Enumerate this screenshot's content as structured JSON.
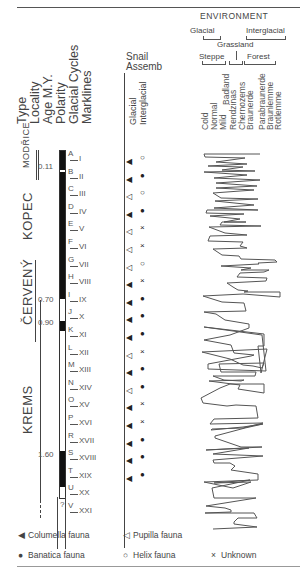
{
  "headers": {
    "columns": [
      "Type",
      "Locality",
      "Age M.Y.",
      "Polarity",
      "Glacial Cycles",
      "Marklines"
    ],
    "snail": {
      "title_line1": "Snail",
      "title_line2": "Assemb",
      "sub": [
        "Glacial",
        "Interglacial"
      ]
    },
    "environment": {
      "title": "ENVIRONMENT",
      "glacial": "Glacial",
      "interglacial": "Interglacial",
      "grassland": "Grassland",
      "steppe": "Steppe",
      "forest": "Forest",
      "types": [
        "Cold",
        "Normal",
        "Mild",
        "Badland",
        "Rendzinas",
        "Chernozems",
        "Braunerde",
        "Parabraunerde",
        "Braunlemme",
        "Rotlemme"
      ]
    }
  },
  "localities": [
    "MODŘICE",
    "KOPEC",
    "ČERVENÝ",
    "KREMS"
  ],
  "ages": [
    "0.11",
    "0.70",
    "0.90",
    "1.60"
  ],
  "glacial_cycles": [
    "A",
    "B",
    "C",
    "D",
    "E",
    "F",
    "G",
    "H",
    "I",
    "J",
    "K",
    "L",
    "M",
    "N",
    "O",
    "P",
    "R",
    "S",
    "T",
    "U",
    "V"
  ],
  "marklines": [
    "I",
    "II",
    "III",
    "IV",
    "V",
    "VI",
    "VII",
    "VIII",
    "IX",
    "X",
    "XI",
    "XII",
    "XIII",
    "XIV",
    "XV",
    "XVI",
    "XVII",
    "XVIII",
    "XIX",
    "XX",
    "XXI"
  ],
  "question_mark": "?",
  "snail_rows": [
    {
      "glacial": "◀",
      "interglacial": "○"
    },
    {
      "glacial": "◀",
      "interglacial": "●"
    },
    {
      "glacial": "◁",
      "interglacial": "○"
    },
    {
      "glacial": "◀",
      "interglacial": "●"
    },
    {
      "glacial": "◁",
      "interglacial": "×"
    },
    {
      "glacial": "◁",
      "interglacial": "×"
    },
    {
      "glacial": "◁",
      "interglacial": "○"
    },
    {
      "glacial": "◀",
      "interglacial": "×"
    },
    {
      "glacial": "◀",
      "interglacial": "●"
    },
    {
      "glacial": "◀",
      "interglacial": "●"
    },
    {
      "glacial": "◀",
      "interglacial": "●"
    },
    {
      "glacial": "◁",
      "interglacial": "×"
    },
    {
      "glacial": "◀",
      "interglacial": "●"
    },
    {
      "glacial": "◁",
      "interglacial": "●"
    },
    {
      "glacial": "◀",
      "interglacial": "×"
    },
    {
      "glacial": "◀",
      "interglacial": "×"
    },
    {
      "glacial": "◀",
      "interglacial": "●"
    },
    {
      "glacial": "◀",
      "interglacial": "●"
    },
    {
      "glacial": "◀",
      "interglacial": "●"
    }
  ],
  "legend": {
    "columella": {
      "symbol": "◀",
      "label": "Columella fauna"
    },
    "pupilla": {
      "symbol": "◁",
      "label": "Pupilla fauna"
    },
    "banatica": {
      "symbol": "●",
      "label": "Banatica fauna"
    },
    "helix": {
      "symbol": "○",
      "label": "Helix fauna"
    },
    "unknown": {
      "symbol": "×",
      "label": "Unknown"
    }
  }
}
